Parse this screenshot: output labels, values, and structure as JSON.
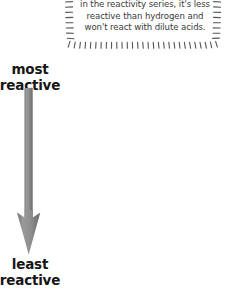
{
  "diagram": {
    "type": "reactivity-series-arrow",
    "title_absent": true
  },
  "note": {
    "name": "reactivity-note",
    "lines": [
      "If a metal is below hydrogen",
      "in the reactivity series, it's less",
      "reactive than hydrogen and",
      "won't react with dilute acids."
    ],
    "full_text": "If a metal is below hydrogen in the reactivity series, it's less reactive than hydrogen and won't react with dilute acids.",
    "border_style": "hand-drawn-dashed",
    "text_color": "#3a3a3a",
    "border_color": "#555555"
  },
  "arrow": {
    "name": "reactivity-gradient-arrow",
    "direction": "down",
    "fill_color": "#8e8e8e",
    "edge_color": "#6d6d6d",
    "top_label_key": "most_reactive",
    "bottom_label_key": "least_reactive"
  },
  "labels": {
    "most_reactive": {
      "lines": [
        "most",
        "reactive"
      ],
      "text": "most reactive",
      "color": "#161616"
    },
    "least_reactive": {
      "lines": [
        "least",
        "reactive"
      ],
      "text": "least reactive",
      "color": "#161616"
    }
  },
  "colors": {
    "background": "#ffffff",
    "arrow_gray": "#8e8e8e",
    "ink": "#161616",
    "note_ink": "#3a3a3a"
  }
}
